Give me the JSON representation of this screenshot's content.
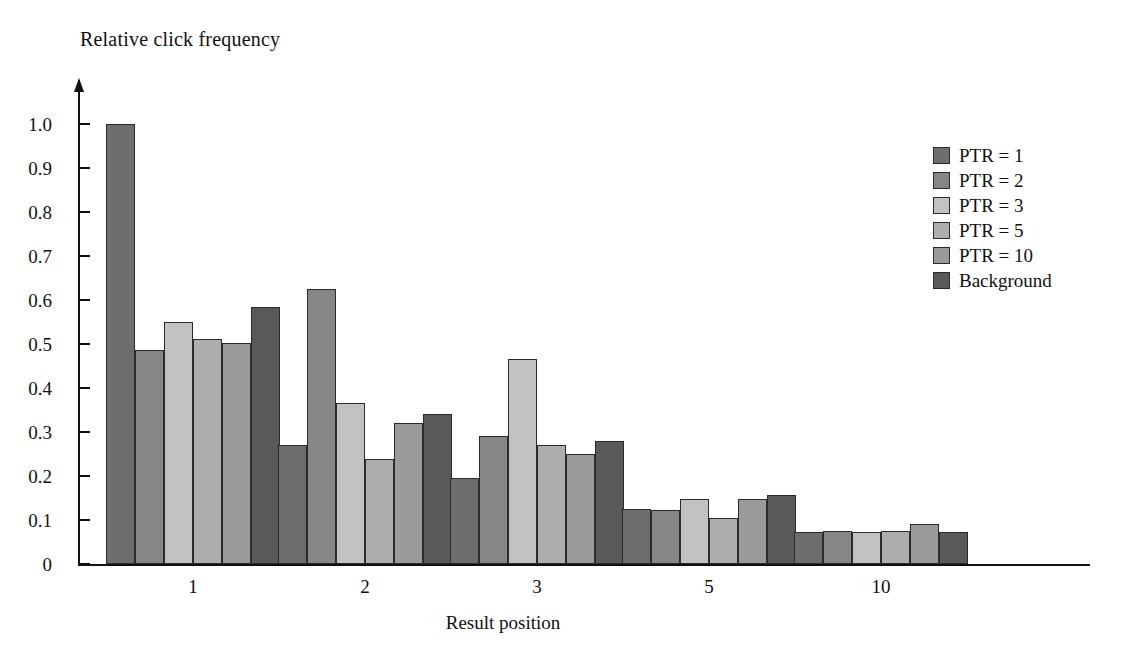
{
  "chart_data": {
    "type": "bar",
    "title": "",
    "ylabel": "Relative click frequency",
    "xlabel": "Result position",
    "categories": [
      "1",
      "2",
      "3",
      "5",
      "10"
    ],
    "ylim": [
      0,
      1.0
    ],
    "yticks": [
      "0",
      "0.1",
      "0.2",
      "0.3",
      "0.4",
      "0.5",
      "0.6",
      "0.7",
      "0.8",
      "0.9",
      "1.0"
    ],
    "ytick_values": [
      0,
      0.1,
      0.2,
      0.3,
      0.4,
      0.5,
      0.6,
      0.7,
      0.8,
      0.9,
      1.0
    ],
    "grid": false,
    "legend_position": "right",
    "series": [
      {
        "name": "PTR = 1",
        "color": "#6e6e6e",
        "values": [
          1.0,
          0.27,
          0.195,
          0.125,
          0.072
        ]
      },
      {
        "name": "PTR = 2",
        "color": "#868686",
        "values": [
          0.487,
          0.625,
          0.29,
          0.122,
          0.075
        ]
      },
      {
        "name": "PTR = 3",
        "color": "#c2c2c2",
        "values": [
          0.55,
          0.365,
          0.467,
          0.148,
          0.072
        ]
      },
      {
        "name": "PTR = 5",
        "color": "#aeaeae",
        "values": [
          0.511,
          0.238,
          0.27,
          0.104,
          0.075
        ]
      },
      {
        "name": "PTR = 10",
        "color": "#9a9a9a",
        "values": [
          0.502,
          0.32,
          0.25,
          0.147,
          0.09
        ]
      },
      {
        "name": "Background",
        "color": "#595959",
        "values": [
          0.585,
          0.34,
          0.28,
          0.156,
          0.073
        ]
      }
    ]
  },
  "axes": {
    "y_title": "Relative click frequency",
    "x_title": "Result position"
  },
  "legend": {
    "items": [
      {
        "label": "PTR = 1"
      },
      {
        "label": "PTR = 2"
      },
      {
        "label": "PTR = 3"
      },
      {
        "label": "PTR = 5"
      },
      {
        "label": "PTR = 10"
      },
      {
        "label": "Background"
      }
    ]
  }
}
